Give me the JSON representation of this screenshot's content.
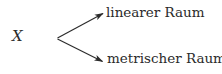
{
  "figure": {
    "type": "branching-diagram",
    "background_color": "#ffffff",
    "ink_color": "#2b2b2b",
    "width": 222,
    "height": 74
  },
  "root": {
    "label": "X",
    "style": "italic-serif-math"
  },
  "branches": [
    {
      "label": "linearer Raum",
      "direction": "up-right",
      "arrow": {
        "from_x": 57,
        "from_y": 38,
        "to_x": 103,
        "to_y": 13,
        "head": "arrowhead-icon"
      }
    },
    {
      "label": "metrischer Raum",
      "direction": "down-right",
      "arrow": {
        "from_x": 57,
        "from_y": 39,
        "to_x": 103,
        "to_y": 62,
        "head": "arrowhead-icon"
      }
    }
  ]
}
